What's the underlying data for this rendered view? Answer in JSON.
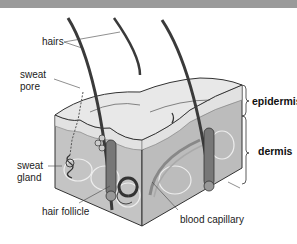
{
  "diagram": {
    "labels": {
      "hairs": "hairs",
      "sweat_pore_line1": "sweat",
      "sweat_pore_line2": "pore",
      "sweat_gland_line1": "sweat",
      "sweat_gland_line2": "gland",
      "hair_follicle": "hair follicle",
      "blood_capillary": "blood capillary",
      "fat_cells": "fat cells",
      "epidermis": "epidermis",
      "dermis": "dermis"
    },
    "colors": {
      "top_band": "#9a9a9a",
      "epidermis_surface": "#e6e6e6",
      "dermis_face": "#bdbdbd",
      "fat_face": "#c9c9c9",
      "hair": "#3a3a3a",
      "outline": "#333333"
    }
  }
}
